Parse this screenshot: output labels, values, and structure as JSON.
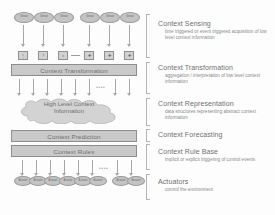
{
  "diagram": {
    "sensors_row": {
      "label": "Sensors",
      "group_a": [
        {
          "label": "Sensor"
        },
        {
          "label": "Sensor"
        },
        {
          "label": "Sensor"
        }
      ],
      "group_b": [
        {
          "label": "Sensor"
        },
        {
          "label": "Sensor"
        },
        {
          "label": "Sensor"
        }
      ]
    },
    "transform_inputs": {
      "left_boxes": [
        {
          "glyph": "⋮"
        },
        {
          "glyph": "?"
        },
        {
          "glyph": "⌗"
        }
      ],
      "right_boxes": [
        {
          "glyph": "✚"
        },
        {
          "glyph": "✚"
        },
        {
          "glyph": "✚"
        }
      ],
      "connector": "—"
    },
    "bars": {
      "context_transformation": "Context Transformation",
      "context_prediction": "Context Prediction",
      "context_rules": "Context Rules"
    },
    "cloud": {
      "line1": "High Level Context",
      "line2": "Information"
    },
    "actuators_row": {
      "label": "Actuators",
      "group_a": [
        {
          "label": "Actuator"
        },
        {
          "label": "Actuator"
        },
        {
          "label": "Actuator"
        },
        {
          "label": "Actuator"
        },
        {
          "label": "Actuator"
        },
        {
          "label": "Actuator"
        }
      ],
      "group_b": [
        {
          "label": "Actuator"
        },
        {
          "label": "Actuator"
        }
      ]
    },
    "ellipsis": "••••"
  },
  "legend": [
    {
      "title": "Context Sensing",
      "desc": "time triggered or event triggered acquisition of low level context information"
    },
    {
      "title": "Context Transformation",
      "desc": "aggregation / interpretation of low level context information"
    },
    {
      "title": "Context Representation",
      "desc": "data structures representing abstract context information"
    },
    {
      "title": "Context Forecasting",
      "desc": ""
    },
    {
      "title": "Context Rule Base",
      "desc": "implicit or explicit triggering of control events"
    },
    {
      "title": "Actuators",
      "desc": "control the environment"
    }
  ],
  "colors": {
    "node_fill": "#c4c4c4",
    "bar_fill": "#c9c9c9",
    "stroke": "#8f8f8f",
    "text": "#6e6e6e",
    "background": "#fdfdfd"
  }
}
